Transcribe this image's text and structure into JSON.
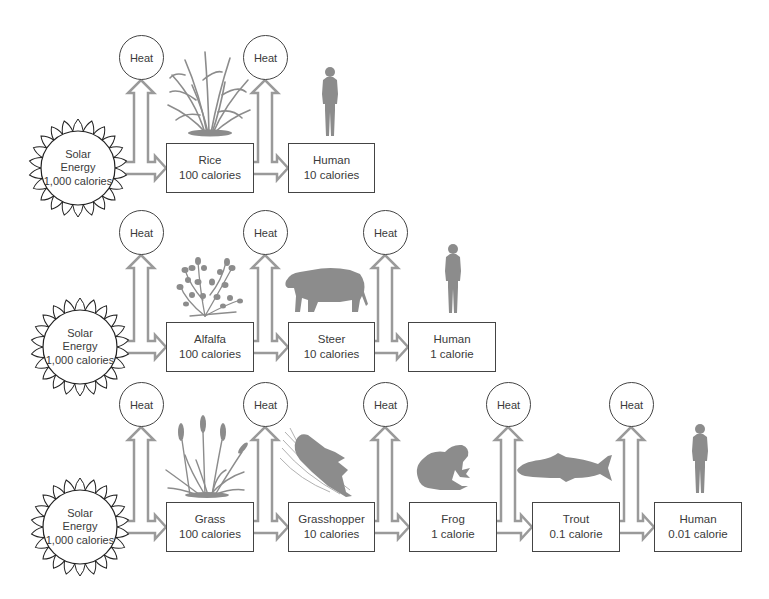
{
  "diagram_type": "food-chain energy flow",
  "colors": {
    "arrow": "#9a9a9a",
    "silhouette": "#8c8c8c",
    "outline": "#444444",
    "background": "#ffffff"
  },
  "rows": [
    {
      "source": {
        "line1": "Solar",
        "line2": "Energy",
        "line3": "1,000 calories",
        "icon": "sun-icon"
      },
      "heat": [
        "Heat",
        "Heat"
      ],
      "levels": [
        {
          "name": "Rice",
          "energy": "100 calories",
          "icon": "rice-plant-icon"
        },
        {
          "name": "Human",
          "energy": "10 calories",
          "icon": "human-icon"
        }
      ]
    },
    {
      "source": {
        "line1": "Solar",
        "line2": "Energy",
        "line3": "1,000 calories",
        "icon": "sun-icon"
      },
      "heat": [
        "Heat",
        "Heat",
        "Heat"
      ],
      "levels": [
        {
          "name": "Alfalfa",
          "energy": "100 calories",
          "icon": "alfalfa-plant-icon"
        },
        {
          "name": "Steer",
          "energy": "10 calories",
          "icon": "steer-icon"
        },
        {
          "name": "Human",
          "energy": "1 calorie",
          "icon": "human-icon"
        }
      ]
    },
    {
      "source": {
        "line1": "Solar",
        "line2": "Energy",
        "line3": "1,000 calories",
        "icon": "sun-icon"
      },
      "heat": [
        "Heat",
        "Heat",
        "Heat",
        "Heat",
        "Heat"
      ],
      "levels": [
        {
          "name": "Grass",
          "energy": "100 calories",
          "icon": "grass-icon"
        },
        {
          "name": "Grasshopper",
          "energy": "10 calories",
          "icon": "grasshopper-icon"
        },
        {
          "name": "Frog",
          "energy": "1 calorie",
          "icon": "frog-icon"
        },
        {
          "name": "Trout",
          "energy": "0.1 calorie",
          "icon": "trout-icon"
        },
        {
          "name": "Human",
          "energy": "0.01 calorie",
          "icon": "human-icon"
        }
      ]
    }
  ]
}
